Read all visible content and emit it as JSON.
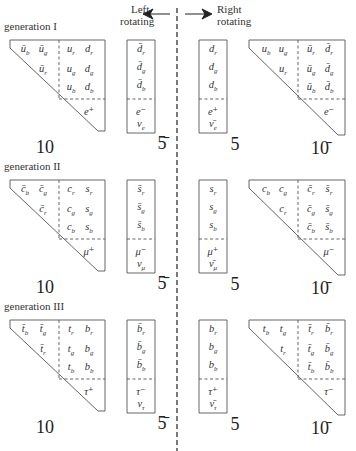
{
  "header": {
    "left_label_line1": "Left",
    "left_label_line2": "rotating",
    "right_label_line1": "Right",
    "right_label_line2": "rotating",
    "left_arrow_icon": "arrow-left",
    "right_arrow_icon": "arrow-right"
  },
  "generations": [
    {
      "label": "generation  I",
      "left_10": {
        "upper_left": [
          [
            "ū_b",
            "ū_g"
          ],
          [
            "",
            "ū_r"
          ]
        ],
        "upper_right": [
          [
            "u_r",
            "d_r"
          ],
          [
            "u_g",
            "d_g"
          ],
          [
            "u_b",
            "d_b"
          ]
        ],
        "lepton": "e⁺",
        "rep_label": "10"
      },
      "left_5bar": {
        "quarks": [
          "d̄_r",
          "d̄_g",
          "d̄_b"
        ],
        "leptons": [
          "e⁻",
          "ν_e"
        ],
        "rep_label": "5̄"
      },
      "right_5": {
        "quarks": [
          "d_r",
          "d_g",
          "d_b"
        ],
        "leptons": [
          "e⁺",
          "ν̄_e"
        ],
        "rep_label": "5"
      },
      "right_10bar": {
        "upper_left": [
          [
            "u_b",
            "u_g"
          ],
          [
            "",
            "u_r"
          ]
        ],
        "upper_right": [
          [
            "ū_r",
            "d̄_r"
          ],
          [
            "ū_g",
            "d̄_g"
          ],
          [
            "ū_b",
            "d̄_b"
          ]
        ],
        "lepton": "e⁻",
        "rep_label": "10̄"
      }
    },
    {
      "label": "generation  II",
      "left_10": {
        "upper_left": [
          [
            "c̄_b",
            "c̄_g"
          ],
          [
            "",
            "c̄_r"
          ]
        ],
        "upper_right": [
          [
            "c_r",
            "s_r"
          ],
          [
            "c_g",
            "s_g"
          ],
          [
            "c_b",
            "s_b"
          ]
        ],
        "lepton": "μ⁺",
        "rep_label": "10"
      },
      "left_5bar": {
        "quarks": [
          "s̄_r",
          "s̄_g",
          "s̄_b"
        ],
        "leptons": [
          "μ⁻",
          "ν_μ"
        ],
        "rep_label": "5̄"
      },
      "right_5": {
        "quarks": [
          "s_r",
          "s_g",
          "s_b"
        ],
        "leptons": [
          "μ⁺",
          "ν̄_μ"
        ],
        "rep_label": "5"
      },
      "right_10bar": {
        "upper_left": [
          [
            "c_b",
            "c_g"
          ],
          [
            "",
            "c_r"
          ]
        ],
        "upper_right": [
          [
            "c̄_r",
            "s̄_r"
          ],
          [
            "c̄_g",
            "s̄_g"
          ],
          [
            "c̄_b",
            "s̄_b"
          ]
        ],
        "lepton": "μ⁻",
        "rep_label": "10̄"
      }
    },
    {
      "label": "generation  III",
      "left_10": {
        "upper_left": [
          [
            "t̄_b",
            "t̄_g"
          ],
          [
            "",
            "t̄_r"
          ]
        ],
        "upper_right": [
          [
            "t_r",
            "b_r"
          ],
          [
            "t_g",
            "b_g"
          ],
          [
            "t_b",
            "b_b"
          ]
        ],
        "lepton": "τ⁺",
        "rep_label": "10"
      },
      "left_5bar": {
        "quarks": [
          "b̄_r",
          "b̄_g",
          "b̄_b"
        ],
        "leptons": [
          "τ⁻",
          "ν_τ"
        ],
        "rep_label": "5̄"
      },
      "right_5": {
        "quarks": [
          "b_r",
          "b_g",
          "b_b"
        ],
        "leptons": [
          "τ⁺",
          "ν̄_τ"
        ],
        "rep_label": "5"
      },
      "right_10bar": {
        "upper_left": [
          [
            "t_b",
            "t_g"
          ],
          [
            "",
            "t_r"
          ]
        ],
        "upper_right": [
          [
            "t̄_r",
            "b̄_r"
          ],
          [
            "t̄_g",
            "b̄_g"
          ],
          [
            "t̄_b",
            "b̄_b"
          ]
        ],
        "lepton": "τ⁻",
        "rep_label": "10̄"
      }
    }
  ],
  "colors": {
    "line": "#555555",
    "text": "#333333",
    "background": "#ffffff"
  }
}
